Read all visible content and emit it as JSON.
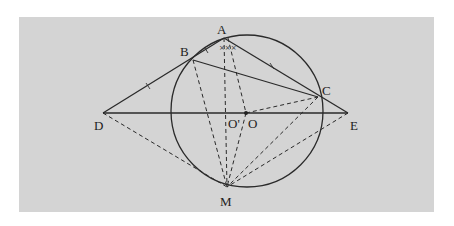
{
  "figure": {
    "background": "#d4d4d4",
    "stroke_color": "#2a2a2a",
    "points": {
      "A": {
        "label": "A",
        "x": 224,
        "y": 38
      },
      "B": {
        "label": "B",
        "x": 193,
        "y": 60
      },
      "C": {
        "label": "C",
        "x": 318,
        "y": 97
      },
      "D": {
        "label": "D",
        "x": 103,
        "y": 113
      },
      "E": {
        "label": "E",
        "x": 348,
        "y": 113
      },
      "M": {
        "label": "M",
        "x": 227,
        "y": 187
      },
      "O_prime": {
        "label": "O'",
        "x": 226,
        "y": 113
      },
      "O": {
        "label": "O",
        "x": 246,
        "y": 113
      }
    },
    "circle": {
      "center": "O",
      "cx": 247,
      "cy": 111,
      "r": 76
    },
    "solid_segments": [
      "DA",
      "AE",
      "BC",
      "DE"
    ],
    "dashed_segments": [
      "DM",
      "EM",
      "BM",
      "AM",
      "AO",
      "OM",
      "CM",
      "O'C"
    ],
    "tick_marks": [
      "DB",
      "AC",
      "angle BAM",
      "angle MAC"
    ]
  }
}
